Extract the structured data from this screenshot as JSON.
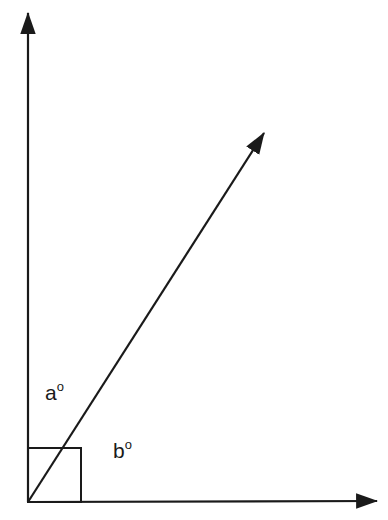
{
  "diagram": {
    "type": "angle-diagram",
    "stroke_color": "#1a1a1a",
    "background": "#ffffff",
    "origin": [
      28,
      502
    ],
    "vertical_axis": {
      "from": [
        28,
        502
      ],
      "to": [
        28,
        13
      ]
    },
    "horizontal_axis": {
      "from": [
        28,
        502
      ],
      "to": [
        377,
        501
      ]
    },
    "ray": {
      "from": [
        28,
        502
      ],
      "to": [
        264,
        133
      ]
    },
    "right_angle_marker": {
      "x": 28,
      "y": 448,
      "width": 53,
      "height": 54
    },
    "labels": [
      {
        "id": "a",
        "letter": "a",
        "degree": "o",
        "x": 45,
        "y": 382
      },
      {
        "id": "b",
        "letter": "b",
        "degree": "o",
        "x": 113,
        "y": 440
      }
    ]
  }
}
